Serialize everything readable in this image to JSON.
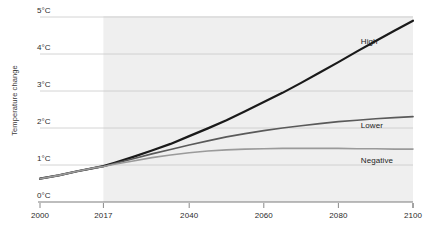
{
  "chart_data": {
    "type": "line",
    "title": "",
    "xlabel": "",
    "ylabel": "Temperature change",
    "xlim": [
      2000,
      2100
    ],
    "ylim": [
      0,
      5
    ],
    "grid": true,
    "legend_position": "inline-right",
    "x_ticks": [
      "2000",
      "2017",
      "2040",
      "2060",
      "2080",
      "2100"
    ],
    "x_tick_values": [
      2000,
      2017,
      2040,
      2060,
      2080,
      2100
    ],
    "y_ticks": [
      "0°C",
      "1°C",
      "2°C",
      "3°C",
      "4°C",
      "5°C"
    ],
    "y_tick_values": [
      0,
      1,
      2,
      3,
      4,
      5
    ],
    "projection_shading": {
      "label": "",
      "start_year": 2017,
      "end_year": 2100,
      "color": "#efefef"
    },
    "x": [
      2000,
      2005,
      2010,
      2015,
      2017,
      2020,
      2025,
      2030,
      2035,
      2040,
      2045,
      2050,
      2055,
      2060,
      2065,
      2070,
      2075,
      2080,
      2085,
      2090,
      2095,
      2100
    ],
    "series": [
      {
        "name": "High",
        "color": "#1a1a1a",
        "width": 2.2,
        "label_x": 2086,
        "label_y": 4.33,
        "values": [
          0.63,
          0.72,
          0.83,
          0.93,
          0.97,
          1.06,
          1.22,
          1.39,
          1.57,
          1.78,
          1.99,
          2.21,
          2.45,
          2.7,
          2.95,
          3.22,
          3.5,
          3.78,
          4.07,
          4.35,
          4.63,
          4.9
        ]
      },
      {
        "name": "Lower",
        "color": "#5a5a5a",
        "width": 1.7,
        "label_x": 2086,
        "label_y": 2.05,
        "values": [
          0.63,
          0.72,
          0.83,
          0.93,
          0.96,
          1.04,
          1.17,
          1.3,
          1.42,
          1.54,
          1.65,
          1.76,
          1.85,
          1.93,
          2.0,
          2.06,
          2.12,
          2.17,
          2.21,
          2.25,
          2.28,
          2.31
        ]
      },
      {
        "name": "Negative",
        "color": "#9a9a9a",
        "width": 1.6,
        "label_x": 2086,
        "label_y": 1.12,
        "values": [
          0.63,
          0.72,
          0.83,
          0.93,
          0.96,
          1.02,
          1.11,
          1.2,
          1.27,
          1.33,
          1.38,
          1.41,
          1.43,
          1.44,
          1.45,
          1.45,
          1.45,
          1.45,
          1.44,
          1.44,
          1.43,
          1.43
        ]
      }
    ]
  }
}
